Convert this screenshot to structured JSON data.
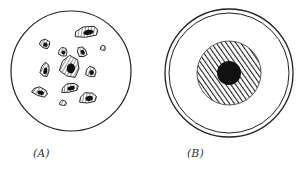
{
  "figure": {
    "panels": [
      {
        "id": "A",
        "label": "(A)",
        "description": "Circular field with scattered irregular hatched particles",
        "circle": {
          "cx": 71,
          "cy": 71,
          "r": 60
        },
        "particles": [
          {
            "cx": 87,
            "cy": 32,
            "rx": 14,
            "ry": 6,
            "rot": -10
          },
          {
            "cx": 45,
            "cy": 44,
            "rx": 6,
            "ry": 5,
            "rot": 20
          },
          {
            "cx": 63,
            "cy": 52,
            "rx": 5,
            "ry": 5,
            "rot": 0
          },
          {
            "cx": 82,
            "cy": 52,
            "rx": 5,
            "ry": 6,
            "rot": -30
          },
          {
            "cx": 103,
            "cy": 48,
            "rx": 3,
            "ry": 3,
            "rot": 0
          },
          {
            "cx": 70,
            "cy": 67,
            "rx": 11,
            "ry": 12,
            "rot": 10
          },
          {
            "cx": 45,
            "cy": 70,
            "rx": 5,
            "ry": 8,
            "rot": 10
          },
          {
            "cx": 91,
            "cy": 72,
            "rx": 6,
            "ry": 6,
            "rot": 0
          },
          {
            "cx": 40,
            "cy": 92,
            "rx": 9,
            "ry": 5,
            "rot": 15
          },
          {
            "cx": 70,
            "cy": 88,
            "rx": 10,
            "ry": 5,
            "rot": -15
          },
          {
            "cx": 88,
            "cy": 98,
            "rx": 10,
            "ry": 6,
            "rot": -10
          },
          {
            "cx": 63,
            "cy": 103,
            "rx": 4,
            "ry": 3,
            "rot": 0
          }
        ]
      },
      {
        "id": "B",
        "label": "(B)",
        "description": "Concentric circles with hatched ring and solid black core",
        "outer_ring": {
          "cx": 229,
          "cy": 73,
          "r": 64
        },
        "inner_ring": {
          "cx": 229,
          "cy": 73,
          "r": 60
        },
        "hatched_disc": {
          "cx": 229,
          "cy": 73,
          "r": 32
        },
        "core": {
          "cx": 229,
          "cy": 73,
          "r": 12
        }
      }
    ],
    "colors": {
      "stroke": "#222222",
      "fill_dark": "#111111",
      "background": "#ffffff"
    }
  }
}
